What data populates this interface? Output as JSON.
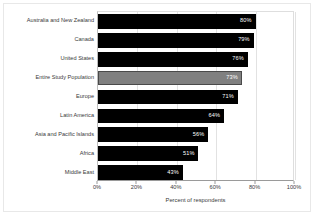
{
  "chart_data": {
    "type": "bar",
    "orientation": "horizontal",
    "title": "",
    "xlabel": "Percent of respondents",
    "ylabel": "",
    "xlim": [
      0,
      100
    ],
    "xticks": [
      "0%",
      "20%",
      "40%",
      "60%",
      "80%",
      "100%"
    ],
    "xtick_values": [
      0,
      20,
      40,
      60,
      80,
      100
    ],
    "grid": true,
    "grid_axis": "x",
    "legend": null,
    "categories": [
      "Australia and New Zealand",
      "Canada",
      "United States",
      "Entire Study Population",
      "Europe",
      "Latin America",
      "Asia and Pacific Islands",
      "Africa",
      "Middle East"
    ],
    "values": [
      80,
      79,
      76,
      73,
      71,
      64,
      56,
      51,
      43
    ],
    "value_labels": [
      "80%",
      "79%",
      "76%",
      "73%",
      "71%",
      "64%",
      "56%",
      "51%",
      "43%"
    ],
    "bar_colors": [
      "#000000",
      "#000000",
      "#000000",
      "#808080",
      "#000000",
      "#000000",
      "#000000",
      "#000000",
      "#000000"
    ],
    "highlight_index": 3,
    "colors": {
      "bar_default": "#000000",
      "bar_highlight": "#808080",
      "value_label": "#ffffff",
      "axis": "#9a9a9a",
      "gridline": "#e2e2e2",
      "text": "#3a3a3a",
      "background": "#ffffff"
    }
  }
}
